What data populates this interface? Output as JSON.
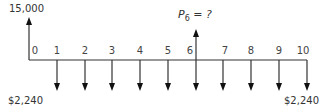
{
  "diagram": {
    "type": "cash-flow-timeline",
    "initial_inflow": {
      "period": 0,
      "label": "15,000",
      "direction": "up"
    },
    "unknown": {
      "period": 6,
      "label_symbol": "P",
      "label_sub": "6",
      "label_rest": " = ?",
      "direction": "up"
    },
    "periods": [
      "0",
      "1",
      "2",
      "3",
      "4",
      "5",
      "6",
      "7",
      "8",
      "9",
      "10"
    ],
    "payments": {
      "periods": [
        1,
        2,
        3,
        4,
        5,
        6,
        7,
        8,
        9,
        10
      ],
      "direction": "down"
    },
    "left_payment_label": "$2,240",
    "right_payment_label": "$2,240"
  }
}
